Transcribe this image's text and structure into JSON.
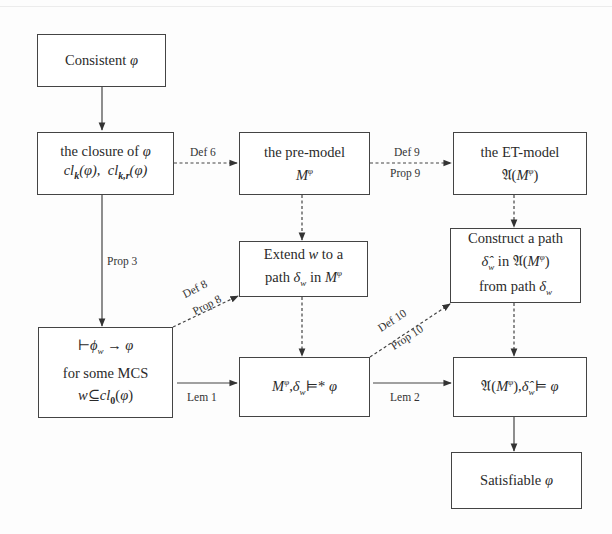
{
  "diagram": {
    "nodes": {
      "consistent": {
        "lines": [
          "Consistent φ"
        ]
      },
      "closure": {
        "lines": [
          "the closure of φ",
          "cl_k(φ),  cl_k,r(φ)"
        ]
      },
      "premodel": {
        "lines": [
          "the pre-model",
          "M^φ"
        ]
      },
      "etmodel": {
        "lines": [
          "the ET-model",
          "𝔄(M^φ)"
        ]
      },
      "extend": {
        "lines": [
          "Extend w to a",
          "path  δ_w  in M^φ"
        ]
      },
      "construct": {
        "lines": [
          "Construct a path",
          "δ̂_w  in 𝔄(M^φ)",
          "from path  δ_w"
        ]
      },
      "mcs": {
        "lines": [
          "⊢φ_w → φ",
          "for some MCS",
          "w ⊆ cl_0(φ)"
        ]
      },
      "premodel_sat": {
        "lines": [
          "M^φ,δ_w ⊨* φ"
        ]
      },
      "etmodel_sat": {
        "lines": [
          "𝔄(M^φ),δ̂_w ⊨ φ"
        ]
      },
      "satisfiable": {
        "lines": [
          "Satisfiable φ"
        ]
      }
    },
    "edges": [
      {
        "from": "consistent",
        "to": "closure",
        "style": "solid",
        "label": ""
      },
      {
        "from": "closure",
        "to": "premodel",
        "style": "dashed",
        "label": "Def 6"
      },
      {
        "from": "premodel",
        "to": "etmodel",
        "style": "dashed",
        "label": "Def 9",
        "label2": "Prop 9"
      },
      {
        "from": "closure",
        "to": "mcs",
        "style": "solid",
        "label": "Prop 3"
      },
      {
        "from": "premodel",
        "to": "extend",
        "style": "dashed",
        "label": ""
      },
      {
        "from": "etmodel",
        "to": "construct",
        "style": "dashed",
        "label": ""
      },
      {
        "from": "mcs",
        "to": "extend",
        "style": "dashed",
        "label": "Def 8",
        "label2": "Prop 8"
      },
      {
        "from": "extend",
        "to": "premodel_sat",
        "style": "dashed",
        "label": ""
      },
      {
        "from": "construct",
        "to": "etmodel_sat",
        "style": "dashed",
        "label": ""
      },
      {
        "from": "mcs",
        "to": "premodel_sat",
        "style": "solid",
        "label": "Lem 1"
      },
      {
        "from": "premodel_sat",
        "to": "construct",
        "style": "dashed",
        "label": "Def 10",
        "label2": "Prop 10"
      },
      {
        "from": "premodel_sat",
        "to": "etmodel_sat",
        "style": "solid",
        "label": "Lem 2"
      },
      {
        "from": "etmodel_sat",
        "to": "satisfiable",
        "style": "solid",
        "label": ""
      }
    ]
  },
  "labels": {
    "def6": "Def 6",
    "def9": "Def 9",
    "prop9": "Prop 9",
    "prop3": "Prop 3",
    "def8": "Def 8",
    "prop8": "Prop 8",
    "lem1": "Lem 1",
    "def10": "Def 10",
    "prop10": "Prop 10",
    "lem2": "Lem 2"
  },
  "text": {
    "consistent": "Consistent ",
    "phi": "φ",
    "closure_1": "the closure of ",
    "premodel_1": "the pre-model",
    "etmodel_1": "the ET-model",
    "extend_1a": "Extend ",
    "extend_1b": " to a",
    "extend_2a": "path  ",
    "extend_2b": "  in ",
    "construct_1": "Construct a path",
    "construct_2b": "  in ",
    "construct_3a": "from path  ",
    "mcs_2": "for some MCS",
    "satisfiable": "Satisfiable ",
    "w": "w",
    "M": "M",
    "frakA": "𝔄",
    "delta": "δ",
    "deltahat": "δ̂",
    "cl": "cl",
    "k": "k",
    "kr": "k,r",
    "zero": "0",
    "turnstile": "⊢",
    "phi_small": "ϕ",
    "arrow": " → ",
    "subseteq": "⊆",
    "models": "⊨",
    "models_star": "⊨*"
  }
}
